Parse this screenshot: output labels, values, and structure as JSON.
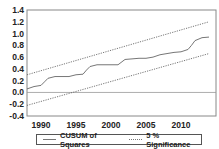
{
  "chart_data": {
    "type": "line",
    "title": "",
    "xlabel": "",
    "ylabel": "",
    "xlim": [
      1988,
      2015
    ],
    "ylim": [
      -0.4,
      1.4
    ],
    "yticks": [
      "1.4",
      "1.2",
      "1.0",
      "0.8",
      "0.6",
      "0.4",
      "0.2",
      "0.0",
      "-0.2",
      "-0.4"
    ],
    "xticks": [
      "1990",
      "1995",
      "2000",
      "2005",
      "2010"
    ],
    "grid": false,
    "legend_position": "bottom",
    "series": [
      {
        "name": "CUSUM of Squares",
        "style": "solid",
        "x": [
          1988,
          1989,
          1990,
          1990.5,
          1991,
          1992,
          1993,
          1994,
          1995,
          1996,
          1996.5,
          1997,
          1998,
          1999,
          2000,
          2001,
          2002,
          2003,
          2004,
          2005,
          2006,
          2007,
          2008,
          2009,
          2010,
          2011,
          2011.5,
          2012,
          2013,
          2014
        ],
        "y": [
          0.06,
          0.1,
          0.12,
          0.18,
          0.24,
          0.27,
          0.27,
          0.27,
          0.3,
          0.31,
          0.38,
          0.44,
          0.47,
          0.47,
          0.47,
          0.47,
          0.56,
          0.57,
          0.58,
          0.58,
          0.6,
          0.64,
          0.66,
          0.68,
          0.69,
          0.73,
          0.8,
          0.88,
          0.93,
          0.94
        ]
      },
      {
        "name": "5 % Significance (upper)",
        "style": "dotted",
        "x": [
          1988,
          2014
        ],
        "y": [
          0.3,
          1.2
        ]
      },
      {
        "name": "5 % Significance (lower)",
        "style": "dotted",
        "x": [
          1988,
          2014
        ],
        "y": [
          -0.22,
          0.66
        ]
      }
    ],
    "reference_line": {
      "y": 0.0
    }
  },
  "legend": {
    "items": [
      {
        "label": "CUSUM of Squares"
      },
      {
        "label": "5 % Significance"
      }
    ]
  }
}
